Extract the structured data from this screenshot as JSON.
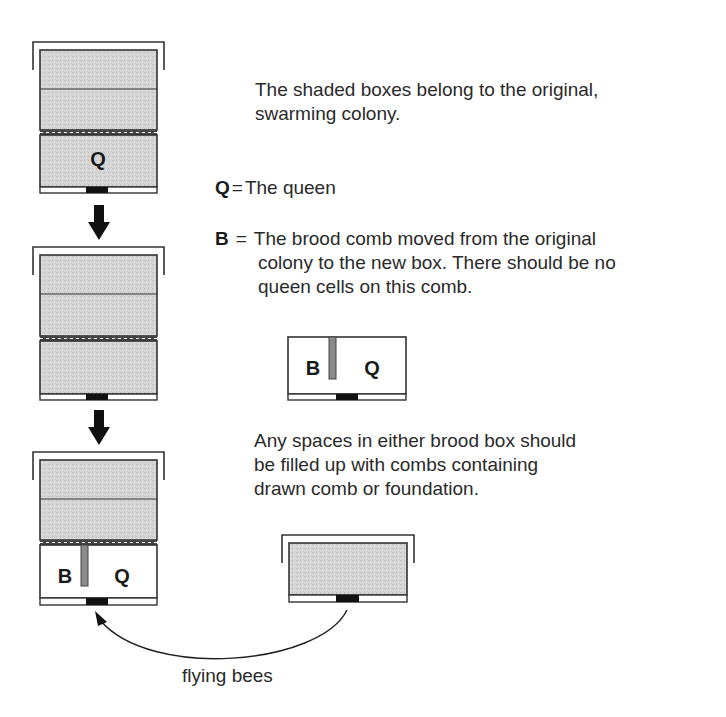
{
  "diagram": {
    "colors": {
      "shade": "#d6d6d6",
      "stroke": "#333333",
      "comb": "#8a8a8a",
      "entrance": "#111111"
    },
    "hives": [
      {
        "id": "step-1",
        "label_q": "Q",
        "label_b": "",
        "note": "original swarming colony, queen in lower brood box"
      },
      {
        "id": "step-2",
        "label_q": "",
        "label_b": "",
        "note": "shaded boxes moved"
      },
      {
        "id": "step-3",
        "label_q": "Q",
        "label_b": "B",
        "note": "new box with brood comb and queen below shaded boxes"
      }
    ],
    "inset_box": {
      "label_b": "B",
      "label_q": "Q"
    },
    "side_hive": {
      "note": "original shaded box placed beside"
    },
    "arrow_label": "flying bees"
  },
  "text": {
    "intro": "The shaded boxes belong to the original, swarming colony.",
    "intro_line1": "The shaded boxes belong to the original,",
    "intro_line2": "swarming colony.",
    "q_key": "Q",
    "q_eq": "=",
    "q_def": "The queen",
    "b_key": "B",
    "b_eq": "=",
    "b_def_line1": "The brood comb moved from the original",
    "b_def_line2": "colony to the new box. There should be no",
    "b_def_line3": "queen cells on this comb.",
    "spaces_line1": "Any spaces in either brood box should",
    "spaces_line2": "be filled up with combs containing",
    "spaces_line3": "drawn comb or foundation."
  }
}
